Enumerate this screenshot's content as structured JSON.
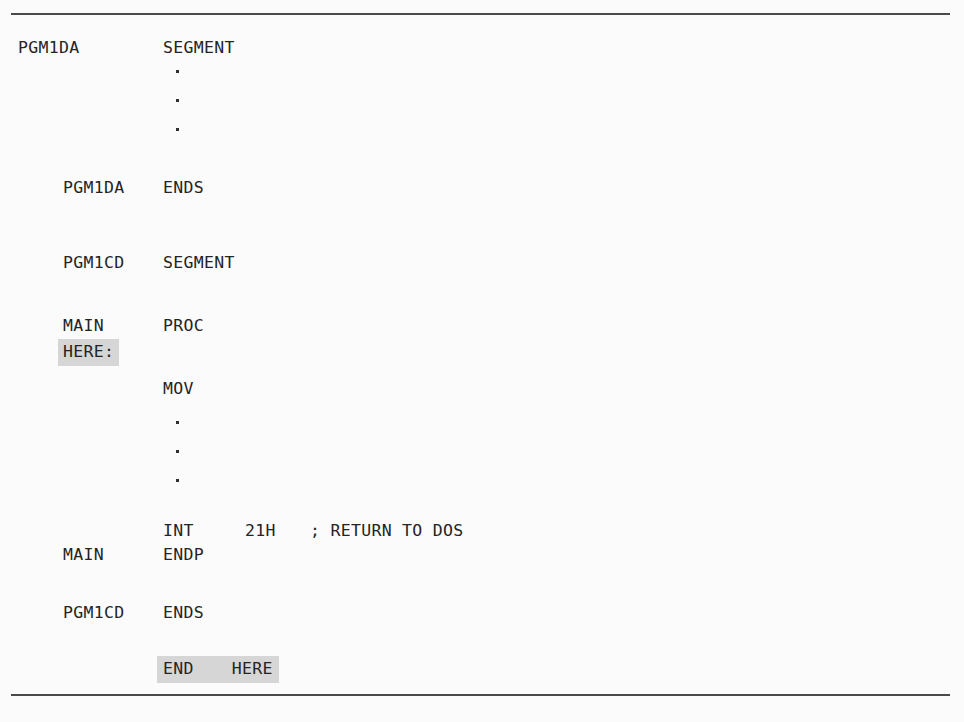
{
  "figure": {
    "kind": "assembly-code-listing",
    "background_color": "#fbfbfb",
    "text_color": "#242424",
    "rule_color": "#4a4a4a",
    "highlight_color": "#d6d6d6"
  },
  "rules": {
    "top": "",
    "bottom": ""
  },
  "code": {
    "lines": [
      {
        "id": "l1",
        "label": "PGM1DA",
        "op": "SEGMENT",
        "operand": "",
        "comment": ""
      },
      {
        "id": "l2",
        "label": "PGM1DA",
        "op": "ENDS",
        "operand": "",
        "comment": ""
      },
      {
        "id": "l3",
        "label": "PGM1CD",
        "op": "SEGMENT",
        "operand": "",
        "comment": ""
      },
      {
        "id": "l4",
        "label": "MAIN",
        "op": "PROC",
        "operand": "",
        "comment": ""
      },
      {
        "id": "l5",
        "label": "HERE:",
        "op": "",
        "operand": "",
        "comment": ""
      },
      {
        "id": "l6",
        "label": "",
        "op": "MOV",
        "operand": "",
        "comment": ""
      },
      {
        "id": "l7",
        "label": "",
        "op": "INT",
        "operand": "21H",
        "comment": "; RETURN TO DOS"
      },
      {
        "id": "l8",
        "label": "MAIN",
        "op": "ENDP",
        "operand": "",
        "comment": ""
      },
      {
        "id": "l9",
        "label": "PGM1CD",
        "op": "ENDS",
        "operand": "",
        "comment": ""
      },
      {
        "id": "l10",
        "label": "",
        "op": "END",
        "operand": "HERE",
        "comment": ""
      }
    ],
    "ellipsis_glyph": "·"
  },
  "highlights": {
    "label_here": "HERE:",
    "end_directive": "END",
    "end_operand": "HERE"
  }
}
